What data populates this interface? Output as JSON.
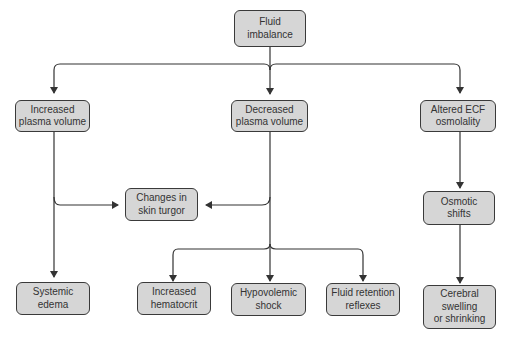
{
  "diagram": {
    "nodes": {
      "root": "Fluid\nimbalance",
      "increased_plasma": "Increased\nplasma volume",
      "decreased_plasma": "Decreased\nplasma volume",
      "altered_ecf": "Altered ECF\nosmolality",
      "skin_turgor": "Changes in\nskin turgor",
      "osmotic_shifts": "Osmotic\nshifts",
      "systemic_edema": "Systemic\nedema",
      "increased_hematocrit": "Increased\nhematocrit",
      "hypovolemic_shock": "Hypovolemic\nshock",
      "fluid_retention": "Fluid retention\nreflexes",
      "cerebral": "Cerebral\nswelling\nor shrinking"
    },
    "edges": [
      [
        "root",
        "increased_plasma"
      ],
      [
        "root",
        "decreased_plasma"
      ],
      [
        "root",
        "altered_ecf"
      ],
      [
        "increased_plasma",
        "skin_turgor"
      ],
      [
        "decreased_plasma",
        "skin_turgor"
      ],
      [
        "increased_plasma",
        "systemic_edema"
      ],
      [
        "decreased_plasma",
        "increased_hematocrit"
      ],
      [
        "decreased_plasma",
        "hypovolemic_shock"
      ],
      [
        "decreased_plasma",
        "fluid_retention"
      ],
      [
        "altered_ecf",
        "osmotic_shifts"
      ],
      [
        "osmotic_shifts",
        "cerebral"
      ]
    ],
    "colors": {
      "node_fill": "#d6d6d6",
      "node_border": "#3a3a3a",
      "line": "#333333"
    }
  }
}
